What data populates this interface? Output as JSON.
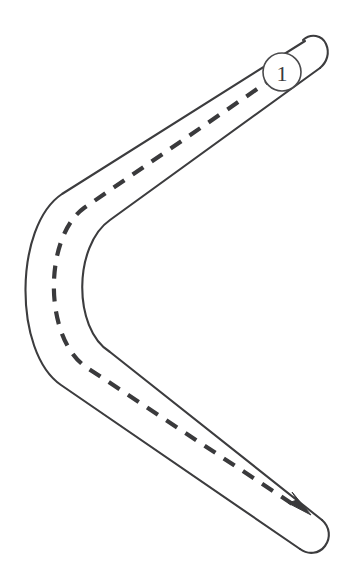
{
  "diagram": {
    "type": "route-path-diagram",
    "background_color": "#ffffff",
    "stroke_color": "#3c3c3e",
    "centerline_color": "#3a3a3c",
    "badge_color": "#4a4a4c"
  },
  "badge": {
    "label": "1",
    "name": "waypoint-marker",
    "cx": 282,
    "cy": 72,
    "r": 19
  },
  "path": {
    "start_label": "1",
    "direction": "start top-right, hairpin left, end bottom-right",
    "outer_edge": "M 307 44 L 62 197 C 20 224 22 353 65 382 L 311 501",
    "inner_edge": "M 313 88 L 104 219 C 62 248 60 325 103 355 L 318 525",
    "centerline": "M 292 66 L 82 208 C 42 236 41 338 84 368 L 303 511",
    "road_width": 44,
    "dash_length": 13,
    "dash_gap": 10,
    "stroke_width": 2.1,
    "centerline_width": 4.2
  },
  "arrow": {
    "name": "direction-arrow",
    "points": "303,511 289,503 296,500 292,493 310,514",
    "tip_x": 310,
    "tip_y": 514
  },
  "end_caps": {
    "start_cap": "rounded rectangle at top right",
    "end_cap": "rounded rectangle at bottom right"
  }
}
